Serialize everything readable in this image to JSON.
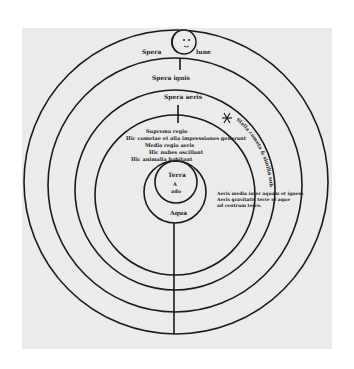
{
  "diagram": {
    "colors": {
      "paper": "#ebebeb",
      "ink": "#1a1a1a",
      "background": "#ffffff"
    },
    "spheres": [
      {
        "id": "moon",
        "label_left": "Spera",
        "label_right": "lune",
        "mark": "7"
      },
      {
        "id": "fire",
        "label": "Spera ignis",
        "mark": "7"
      },
      {
        "id": "air",
        "label": "Spera aeris",
        "mark": "7"
      }
    ],
    "air_regions": {
      "upper": "Suprema regio",
      "lines": [
        "Hic cometae et alia impressiones generant",
        "Media regio aeris",
        "Hic nubes oscillant",
        "Hic animalia habitant"
      ]
    },
    "curved_note": "Stella cometa & similia sub orbe",
    "right_notes": [
      "Aeris media inter aquam et ignem",
      "Aeris gravitatis terre et aque",
      "ad centrum terre."
    ],
    "inner": {
      "earth": "Terra",
      "earth_glyph": "A",
      "earth_sub": "ado",
      "water": "Aqua"
    }
  }
}
